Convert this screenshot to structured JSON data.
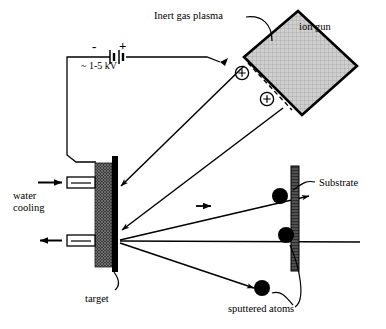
{
  "figure": {
    "labels": {
      "inert_gas_plasma": "Inert gas plasma",
      "ion_gun": "ion gun",
      "polarity_negative": "-",
      "polarity_positive": "+",
      "voltage": "~ 1-5 kV",
      "water_cooling_line1": "water",
      "water_cooling_line2": "cooling",
      "substrate": "Substrate",
      "target": "target",
      "sputtered_atoms": "sputtered atoms",
      "ion_charge_1": "+",
      "ion_charge_2": "+"
    },
    "colors": {
      "stroke": "#000000",
      "background": "#ffffff",
      "ion_gun_fill": "#c9c9c9",
      "target_block_fill": "#4a4a4a",
      "target_bar_fill": "#000000",
      "substrate_fill": "#3d3d3d",
      "atom_fill": "#000000"
    },
    "components": {
      "ion_gun_shape": "rotated-square",
      "ion_count": 2,
      "ion_beam_arrow_count": 2,
      "sputtered_atom_count": 3,
      "water_cooling_port_count": 2,
      "water_inlet_direction": "right",
      "water_outlet_direction": "left"
    }
  }
}
